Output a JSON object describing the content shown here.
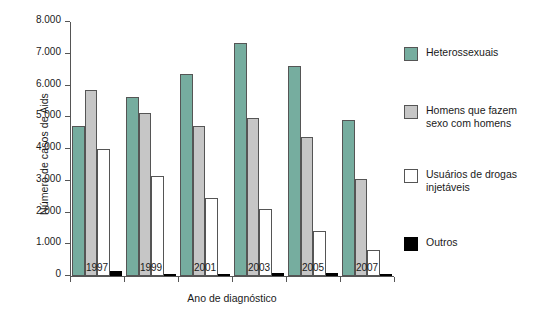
{
  "chart_data": {
    "type": "bar",
    "title": "",
    "xlabel": "Ano de diagnóstico",
    "ylabel": "Número de casos de Aids",
    "categories": [
      "1997",
      "1999",
      "2001",
      "2003",
      "2005",
      "2007"
    ],
    "ylim": [
      0,
      8000
    ],
    "ytick_values": [
      0,
      1000,
      2000,
      3000,
      4000,
      5000,
      6000,
      7000,
      8000
    ],
    "ytick_labels": [
      "0",
      "1.000",
      "2.000",
      "3.000",
      "4.000",
      "5.000",
      "6.000",
      "7.000",
      "8.000"
    ],
    "grid": false,
    "legend_position": "right",
    "series": [
      {
        "name": "Heterossexuais",
        "color": "#76ad9f",
        "values": [
          4720,
          5650,
          6370,
          7330,
          6600,
          4900
        ]
      },
      {
        "name": "Homens que fazem\nsexo com homens",
        "color": "#c6c6c6",
        "values": [
          5860,
          5120,
          4720,
          4990,
          4380,
          3040
        ]
      },
      {
        "name": "Usuários de drogas\ninjetáveis",
        "color": "#ffffff",
        "values": [
          4000,
          3140,
          2450,
          2110,
          1420,
          830
        ]
      },
      {
        "name": "Outros",
        "color": "#000000",
        "values": [
          150,
          60,
          75,
          90,
          80,
          65
        ]
      }
    ]
  }
}
